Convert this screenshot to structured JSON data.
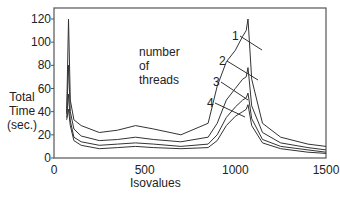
{
  "chart_data": {
    "type": "line",
    "title": "",
    "xlabel": "Isovalues",
    "ylabel": "Total Time (sec.)",
    "xlim": [
      0,
      1500
    ],
    "ylim": [
      0,
      120
    ],
    "xticks": [
      "0",
      "500",
      "1000",
      "1500"
    ],
    "yticks": [
      "0",
      "20",
      "40",
      "60",
      "80",
      "100",
      "120"
    ],
    "grid": false,
    "legend_position": "inline annotation",
    "annotation": "number of threads",
    "x": [
      70,
      80,
      90,
      110,
      150,
      250,
      350,
      450,
      550,
      700,
      850,
      900,
      950,
      1000,
      1040,
      1060,
      1070,
      1090,
      1150,
      1250,
      1400,
      1500
    ],
    "series": [
      {
        "name": "1",
        "values": [
          40,
          120,
          50,
          33,
          28,
          22,
          24,
          28,
          25,
          20,
          30,
          62,
          83,
          93,
          105,
          110,
          120,
          68,
          30,
          18,
          12,
          10
        ]
      },
      {
        "name": "2",
        "values": [
          38,
          80,
          40,
          25,
          19,
          15,
          16,
          18,
          16,
          14,
          18,
          30,
          50,
          60,
          68,
          70,
          78,
          45,
          22,
          13,
          9,
          7
        ]
      },
      {
        "name": "3",
        "values": [
          35,
          55,
          32,
          18,
          14,
          11,
          12,
          13,
          12,
          10,
          12,
          20,
          35,
          44,
          50,
          52,
          56,
          34,
          16,
          10,
          7,
          5
        ]
      },
      {
        "name": "4",
        "values": [
          33,
          42,
          28,
          15,
          11,
          8,
          9,
          10,
          9,
          8,
          9,
          15,
          28,
          36,
          40,
          42,
          46,
          28,
          13,
          8,
          5,
          4
        ]
      }
    ]
  },
  "labels": {
    "ylabel_line1": "Total",
    "ylabel_line2": "Time",
    "ylabel_line3": "(sec.)",
    "xlabel": "Isovalues",
    "annotation_line1": "number",
    "annotation_line2": "of",
    "annotation_line3": "threads"
  }
}
